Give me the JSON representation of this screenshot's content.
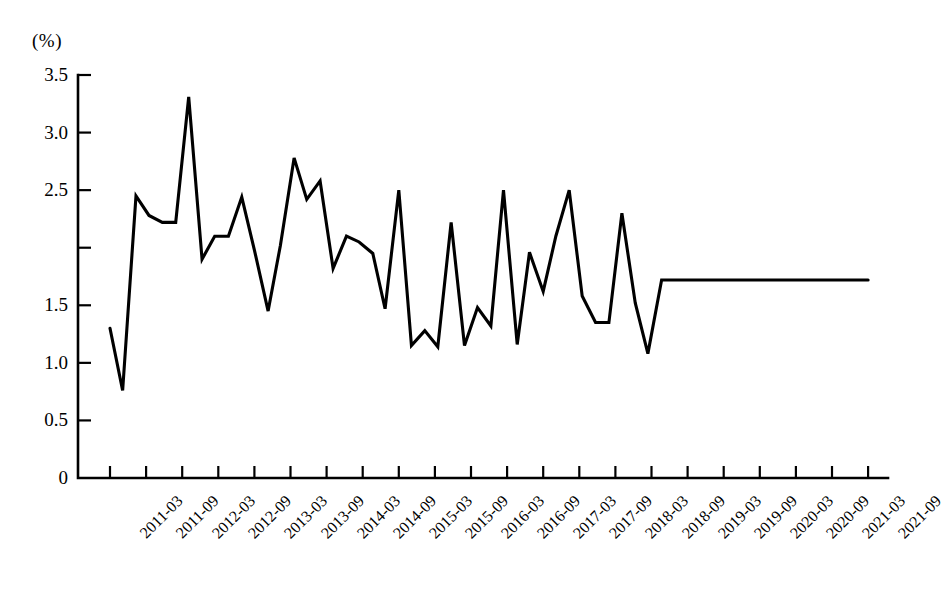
{
  "chart_data": {
    "type": "line",
    "title": "",
    "xlabel": "",
    "ylabel": "(%)",
    "unit_label": "(%)",
    "ylim": [
      0,
      3.5
    ],
    "grid": false,
    "legend": null,
    "y_ticks": [
      0,
      0.5,
      1.0,
      1.5,
      2.0,
      2.5,
      3.0,
      3.5
    ],
    "y_tick_labels": [
      "0",
      "0.5",
      "1.0",
      "1.5",
      "2.0",
      "2.5",
      "3.0",
      "3.5"
    ],
    "y_tick_label_visible": [
      true,
      true,
      true,
      true,
      false,
      true,
      true,
      true
    ],
    "categories": [
      "2011-03",
      "2011-09",
      "2012-03",
      "2012-09",
      "2013-03",
      "2013-09",
      "2014-03",
      "2014-09",
      "2015-03",
      "2015-09",
      "2016-03",
      "2016-09",
      "2017-03",
      "2017-09",
      "2018-03",
      "2018-09",
      "2019-03",
      "2019-09",
      "2020-03",
      "2020-09",
      "2021-03",
      "2021-09"
    ],
    "series": [
      {
        "name": "",
        "x": [
          0,
          0.35,
          0.72,
          1.08,
          1.45,
          1.82,
          2.18,
          2.55,
          2.9,
          3.28,
          3.65,
          4.0,
          4.38,
          4.72,
          5.1,
          5.45,
          5.82,
          6.18,
          6.55,
          6.9,
          7.28,
          7.62,
          8.0,
          8.35,
          8.72,
          9.08,
          9.45,
          9.82,
          10.18,
          10.55,
          10.9,
          11.28,
          11.62,
          12.0,
          12.35,
          12.72,
          13.08,
          13.45,
          13.82,
          14.18,
          14.55,
          14.9,
          15.28,
          15.62,
          16.0,
          16.35,
          16.72,
          17.08,
          17.45,
          17.82,
          18.18,
          18.55,
          18.9,
          19.28,
          19.62,
          20.0,
          20.35,
          20.72,
          21.0
        ],
        "values": [
          1.3,
          0.76,
          2.45,
          2.28,
          2.22,
          2.22,
          3.31,
          1.9,
          2.1,
          2.1,
          2.44,
          1.98,
          1.45,
          2.02,
          2.78,
          2.42,
          2.58,
          1.82,
          2.1,
          2.05,
          1.95,
          1.47,
          2.5,
          1.15,
          1.28,
          1.14,
          2.22,
          1.15,
          1.48,
          1.32,
          2.5,
          1.16,
          1.96,
          1.62,
          2.1,
          2.5,
          1.58,
          1.35,
          1.35,
          2.3,
          1.52,
          1.08,
          1.72,
          1.72,
          1.72,
          1.72,
          1.72,
          1.72,
          1.72,
          1.72,
          1.72,
          1.72,
          1.72,
          1.72,
          1.72,
          1.72,
          1.72,
          1.72,
          1.72
        ]
      }
    ],
    "notes": {
      "peak_value": 3.31,
      "peak_label": "2013-01",
      "min_value": 0.76,
      "min_label": "2011-06",
      "last_value": 1.72,
      "point_count": 43
    }
  }
}
